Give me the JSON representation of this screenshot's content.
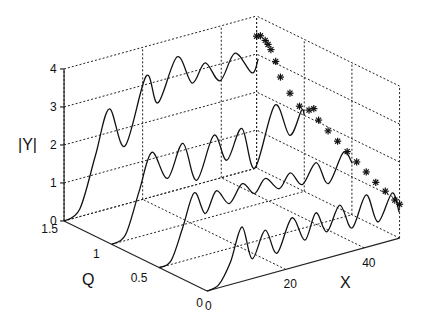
{
  "chart_data": {
    "type": "line",
    "subtype": "3d-waterfall",
    "title": "",
    "xlabel": "X",
    "ylabel": "Q",
    "zlabel": "|Y|",
    "xlim": [
      0,
      49
    ],
    "ylim": [
      0,
      1.5
    ],
    "zlim": [
      0,
      4
    ],
    "x_ticks": [
      0,
      20,
      40
    ],
    "y_ticks": [
      0,
      0.5,
      1,
      1.5
    ],
    "z_ticks": [
      0,
      1,
      2,
      3,
      4
    ],
    "grid": true,
    "series": [
      {
        "name": "Q=0",
        "q": 0,
        "points": [
          [
            0,
            0
          ],
          [
            3,
            0.08
          ],
          [
            6,
            0.6
          ],
          [
            8.9,
            1.43
          ],
          [
            11.5,
            0.52
          ],
          [
            14.8,
            1.18
          ],
          [
            17.8,
            0.49
          ],
          [
            21.6,
            1.31
          ],
          [
            24.9,
            0.63
          ],
          [
            27.7,
            1.27
          ],
          [
            30.5,
            0.69
          ],
          [
            33.8,
            1.3
          ],
          [
            36.9,
            0.61
          ],
          [
            40.5,
            1.38
          ],
          [
            43.5,
            0.58
          ],
          [
            47.1,
            1.24
          ],
          [
            48.9,
            0.68
          ]
        ]
      },
      {
        "name": "Q=0.5",
        "q": 0.5,
        "points": [
          [
            0,
            0
          ],
          [
            3,
            0.1
          ],
          [
            6,
            0.9
          ],
          [
            8.9,
            1.72
          ],
          [
            11.7,
            1.09
          ],
          [
            14.5,
            1.61
          ],
          [
            17.8,
            1.18
          ],
          [
            21.1,
            1.61
          ],
          [
            24.2,
            1.26
          ],
          [
            27.0,
            1.58
          ],
          [
            30.5,
            1.21
          ],
          [
            33.3,
            1.55
          ],
          [
            36.4,
            1.15
          ],
          [
            39.9,
            1.63
          ],
          [
            43.0,
            0.99
          ],
          [
            46.8,
            1.7
          ],
          [
            49.1,
            1.35
          ]
        ]
      },
      {
        "name": "Q=1",
        "q": 1,
        "points": [
          [
            0,
            0
          ],
          [
            3.5,
            0.15
          ],
          [
            7,
            1.2
          ],
          [
            10.2,
            2.13
          ],
          [
            14.2,
            1.33
          ],
          [
            18.1,
            2.14
          ],
          [
            21.6,
            1.07
          ],
          [
            26.0,
            2.13
          ],
          [
            29.3,
            1.38
          ],
          [
            33.1,
            2.11
          ],
          [
            36.4,
            0.97
          ],
          [
            41.5,
            2.48
          ],
          [
            45.3,
            1.58
          ],
          [
            48.3,
            2.15
          ],
          [
            49,
            2.0
          ]
        ]
      },
      {
        "name": "Q=1.5",
        "q": 1.5,
        "points": [
          [
            0,
            0
          ],
          [
            4,
            0.2
          ],
          [
            8,
            1.5
          ],
          [
            11.5,
            2.62
          ],
          [
            15.5,
            1.53
          ],
          [
            20.9,
            3.22
          ],
          [
            23.9,
            2.43
          ],
          [
            28.8,
            3.5
          ],
          [
            32.6,
            2.7
          ],
          [
            35.9,
            3.14
          ],
          [
            39.7,
            2.56
          ],
          [
            43.5,
            3.18
          ],
          [
            47.8,
            2.54
          ],
          [
            49.4,
            2.86
          ]
        ]
      }
    ],
    "markers": {
      "symbol": "asterisk",
      "x_plane": 49,
      "points_q_z": [
        [
          1.5,
          3.47
        ],
        [
          1.46,
          3.53
        ],
        [
          1.41,
          3.47
        ],
        [
          1.38,
          3.4
        ],
        [
          1.35,
          3.3
        ],
        [
          1.3,
          3.05
        ],
        [
          1.25,
          2.7
        ],
        [
          1.15,
          2.4
        ],
        [
          1.05,
          2.18
        ],
        [
          0.95,
          2.2
        ],
        [
          0.9,
          2.3
        ],
        [
          0.85,
          2.06
        ],
        [
          0.75,
          1.9
        ],
        [
          0.65,
          1.75
        ],
        [
          0.55,
          1.6
        ],
        [
          0.45,
          1.45
        ],
        [
          0.35,
          1.31
        ],
        [
          0.25,
          1.16
        ],
        [
          0.15,
          1.05
        ],
        [
          0.05,
          0.94
        ],
        [
          0,
          0.89
        ]
      ]
    }
  },
  "labels": {
    "z_axis": "|Y|",
    "q_axis": "Q",
    "x_axis": "X"
  }
}
